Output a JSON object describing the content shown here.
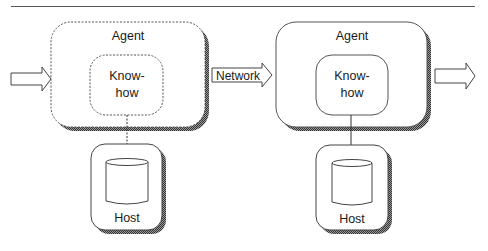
{
  "diagram": {
    "agents": [
      {
        "label": "Agent",
        "knowhow_line1": "Know-",
        "knowhow_line2": "how",
        "style": "dashed"
      },
      {
        "label": "Agent",
        "knowhow_line1": "Know-",
        "knowhow_line2": "how",
        "style": "solid"
      }
    ],
    "hosts": [
      {
        "label": "Host"
      },
      {
        "label": "Host"
      }
    ],
    "arrows": {
      "input": "",
      "network": "Network",
      "output": ""
    },
    "colors": {
      "stroke": "#333333",
      "shadow": "#555555",
      "background": "#ffffff"
    }
  }
}
